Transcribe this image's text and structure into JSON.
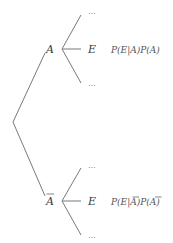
{
  "diagram": {
    "type": "probability-tree",
    "root": {
      "x": 13,
      "y": 122
    },
    "nodes": [
      {
        "id": "A",
        "label": "A",
        "complement": false,
        "x": 51,
        "y": 49,
        "branch_origin": {
          "x": 62,
          "y": 49
        },
        "children": [
          {
            "label": "...",
            "x": 81,
            "y": 14,
            "tx": 88,
            "ty": 14
          },
          {
            "label": "E",
            "x": 81,
            "y": 49,
            "tx": 88,
            "ty": 53
          },
          {
            "label": "...",
            "x": 81,
            "y": 84,
            "tx": 88,
            "ty": 86
          }
        ],
        "formula": "P(E|A)P(A)"
      },
      {
        "id": "A-bar",
        "label": "A",
        "complement": true,
        "x": 51,
        "y": 201,
        "branch_origin": {
          "x": 62,
          "y": 201
        },
        "children": [
          {
            "label": "...",
            "x": 81,
            "y": 167,
            "tx": 88,
            "ty": 168
          },
          {
            "label": "E",
            "x": 81,
            "y": 201,
            "tx": 88,
            "ty": 205
          },
          {
            "label": "...",
            "x": 81,
            "y": 236,
            "tx": 88,
            "ty": 238
          }
        ],
        "formula": "P(E|A)P(A)",
        "formula_overlined": [
          "A",
          "A"
        ]
      }
    ],
    "labels": {
      "top_node": "A",
      "bottom_node": "A",
      "event": "E",
      "ellipsis": "...",
      "top_formula": {
        "p1": "P(",
        "e": "E",
        "bar": "|",
        "a1": "A",
        "mid": ")P(",
        "a2": "A",
        "end": ")"
      },
      "bottom_formula": {
        "p1": "P(",
        "e": "E",
        "bar": "|",
        "a1": "A",
        "mid": ")P(",
        "a2": "A",
        "end": ")"
      }
    },
    "colors": {
      "line": "#6a6a6a",
      "text": "#3a3a3a",
      "background": "#ffffff"
    }
  }
}
